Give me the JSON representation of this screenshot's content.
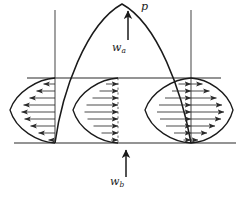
{
  "figure": {
    "kind": "engineering-load-diagram",
    "background_color": "#ffffff",
    "stroke_color": "#1a1a1a",
    "width": 243,
    "height": 198,
    "labels": {
      "peak_load": {
        "text": "p",
        "base": "p",
        "sub": ""
      },
      "upper_deflection": {
        "text": "wa",
        "base": "w",
        "sub": "a"
      },
      "lower_deflection": {
        "text": "wb",
        "base": "w",
        "sub": "b"
      }
    },
    "geometry": {
      "left_boundary_x": 55,
      "right_boundary_x": 191,
      "center_x": 118,
      "upper_line_y": 78,
      "baseline_y": 143,
      "parabola_peak_x": 122,
      "parabola_peak_y": 3,
      "boundary_top_y": 10,
      "upper_line_left_x": 27,
      "upper_line_right_x": 221,
      "baseline_left_x": 14,
      "baseline_right_x": 236
    },
    "arrows": {
      "peak_arrow": {
        "x": 128,
        "y_tail": 40,
        "y_head": 10,
        "direction": "up"
      },
      "bottom_arrow": {
        "x": 126,
        "y_tail": 176,
        "y_head": 150,
        "direction": "up"
      }
    },
    "profiles": [
      {
        "name": "outer-left-lobe",
        "direction": "left",
        "rows": 9,
        "apex_x": 10,
        "anchor_x": 55
      },
      {
        "name": "inner-left-lobe",
        "direction": "right",
        "rows": 9,
        "apex_x": 73,
        "anchor_x": 118
      },
      {
        "name": "inner-right-lobe",
        "direction": "right",
        "rows": 9,
        "apex_x": 145,
        "anchor_x": 191
      },
      {
        "name": "outer-right-lobe",
        "direction": "right",
        "rows": 9,
        "apex_x": 232,
        "anchor_x": 191
      }
    ]
  }
}
